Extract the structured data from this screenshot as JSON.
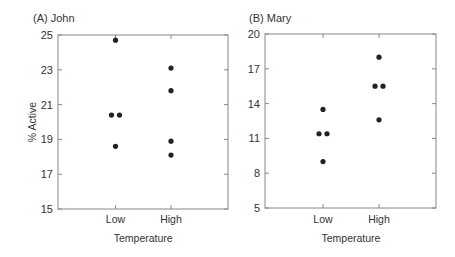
{
  "chart_data": [
    {
      "type": "scatter",
      "title": "(A)  John",
      "xlabel": "Temperature",
      "ylabel": "% Active",
      "categories": [
        "Low",
        "High"
      ],
      "ylim": [
        15,
        25
      ],
      "yticks": [
        15,
        17,
        19,
        21,
        23,
        25
      ],
      "grid": false,
      "points": [
        {
          "x": "Low",
          "y": 24.7,
          "offset": 0
        },
        {
          "x": "Low",
          "y": 20.4,
          "offset": -1
        },
        {
          "x": "Low",
          "y": 20.4,
          "offset": 1
        },
        {
          "x": "Low",
          "y": 18.6,
          "offset": 0
        },
        {
          "x": "High",
          "y": 23.1,
          "offset": 0
        },
        {
          "x": "High",
          "y": 21.8,
          "offset": 0
        },
        {
          "x": "High",
          "y": 18.9,
          "offset": 0
        },
        {
          "x": "High",
          "y": 18.1,
          "offset": 0
        }
      ]
    },
    {
      "type": "scatter",
      "title": "(B)  Mary",
      "xlabel": "Temperature",
      "ylabel": "",
      "categories": [
        "Low",
        "High"
      ],
      "ylim": [
        5,
        20
      ],
      "yticks": [
        5,
        8,
        11,
        14,
        17,
        20
      ],
      "grid": false,
      "points": [
        {
          "x": "Low",
          "y": 13.5,
          "offset": 0
        },
        {
          "x": "Low",
          "y": 11.4,
          "offset": -1
        },
        {
          "x": "Low",
          "y": 11.4,
          "offset": 1
        },
        {
          "x": "Low",
          "y": 9.0,
          "offset": 0
        },
        {
          "x": "High",
          "y": 18.0,
          "offset": 0
        },
        {
          "x": "High",
          "y": 15.5,
          "offset": -1
        },
        {
          "x": "High",
          "y": 15.5,
          "offset": 1
        },
        {
          "x": "High",
          "y": 12.6,
          "offset": 0
        }
      ]
    }
  ],
  "colors": {
    "axis": "#888888",
    "point": "#222222",
    "text": "#333333"
  }
}
